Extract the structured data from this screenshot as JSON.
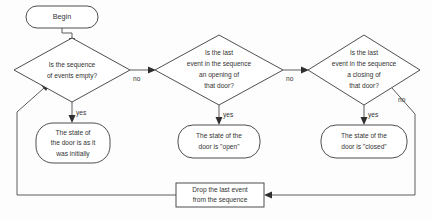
{
  "diagram": {
    "type": "flowchart",
    "background_color": "#fdfdfd",
    "line_color": "#4a4a4a",
    "text_color": "#333333",
    "nodes": {
      "begin": {
        "shape": "stadium",
        "label": "Begin"
      },
      "decision_empty": {
        "shape": "diamond",
        "line1": "Is the sequence",
        "line2": "of events empty?"
      },
      "decision_opening": {
        "shape": "diamond",
        "line1": "Is the last",
        "line2": "event in the sequence",
        "line3": "an opening of",
        "line4": "that door?"
      },
      "decision_closing": {
        "shape": "diamond",
        "line1": "Is the last",
        "line2": "event in the sequence",
        "line3": "a closing of",
        "line4": "that door?"
      },
      "result_initial": {
        "shape": "rounded-rect",
        "line1": "The state of",
        "line2": "the door is as it",
        "line3": "was initially"
      },
      "result_open": {
        "shape": "rounded-rect",
        "line1": "The state of the",
        "line2": "door is \"open\""
      },
      "result_closed": {
        "shape": "rounded-rect",
        "line1": "The state of the",
        "line2": "door is \"closed\""
      },
      "drop_event": {
        "shape": "rect",
        "line1": "Drop the last event",
        "line2": "from the sequence"
      }
    },
    "edge_labels": {
      "empty_no": "no",
      "empty_yes": "yes",
      "opening_no": "no",
      "opening_yes": "yes",
      "closing_no": "no",
      "closing_yes": "yes"
    }
  }
}
